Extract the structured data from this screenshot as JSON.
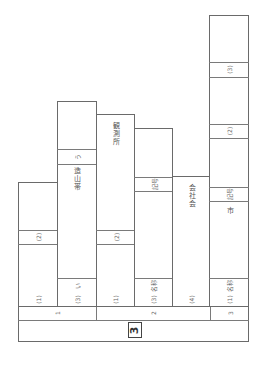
{
  "sheet": {
    "section_number": "3",
    "groups": [
      {
        "label": "1"
      },
      {
        "label": "2"
      },
      {
        "label": "3"
      }
    ],
    "columns": [
      {
        "item": "(1)",
        "bands": [
          {
            "label": "(2)"
          }
        ]
      },
      {
        "item": "(3)",
        "bands": [
          {
            "label": "い"
          },
          {
            "label": "う"
          }
        ],
        "vertical_text": "造山帯"
      },
      {
        "item": "(1)",
        "bands": [
          {
            "label": "(2)"
          }
        ],
        "vertical_text": "観測所"
      },
      {
        "item": "(3)",
        "bands": [
          {
            "label": "名称"
          },
          {
            "label": "記号"
          }
        ]
      },
      {
        "item": "(4)",
        "vertical_text": "会社会"
      },
      {
        "item": "(1)",
        "bands": [
          {
            "label": "名称"
          },
          {
            "label": "記号"
          },
          {
            "label": "(2)"
          },
          {
            "label": "(3)"
          }
        ],
        "vertical_text": "市"
      }
    ]
  }
}
